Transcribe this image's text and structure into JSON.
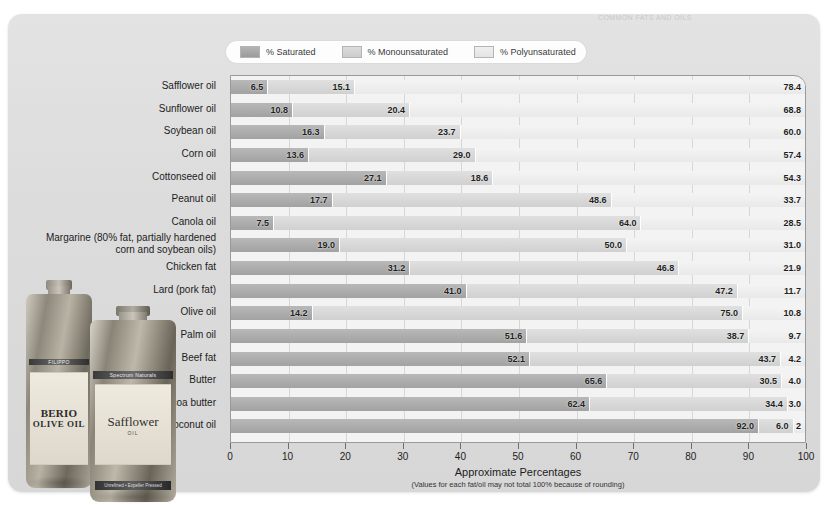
{
  "poster": {
    "top_strip_text": "COMMON FATS AND OILS"
  },
  "legend": {
    "items": [
      {
        "label": "% Saturated",
        "color": "#a2a2a2"
      },
      {
        "label": "% Monounsaturated",
        "color": "#d0d0d0"
      },
      {
        "label": "% Polyunsaturated",
        "color": "#e9e9e9"
      }
    ]
  },
  "axis": {
    "title": "Approximate Percentages",
    "subtitle": "(Values for each fat/oil may not total 100% because of rounding)",
    "ticks": [
      "0",
      "10",
      "20",
      "30",
      "40",
      "50",
      "60",
      "70",
      "80",
      "90",
      "100"
    ]
  },
  "photo": {
    "bottle1": {
      "brand": "FILIPPO",
      "brand2": "BERIO",
      "product": "OLIVE OIL"
    },
    "bottle2": {
      "neckband": "Spectrum Naturals",
      "product": "Safflower",
      "sub": "OIL",
      "footband": "Unrefined  •  Expeller Pressed"
    }
  },
  "chart_data": {
    "type": "bar",
    "orientation": "horizontal",
    "stacked": true,
    "title": "Approximate Percentages",
    "xlabel": "Approximate Percentages",
    "ylabel": "",
    "xlim": [
      0,
      100
    ],
    "grid": true,
    "legend_position": "top",
    "categories": [
      "Safflower oil",
      "Sunflower oil",
      "Soybean oil",
      "Corn oil",
      "Cottonseed oil",
      "Peanut oil",
      "Canola oil",
      "Margarine (80% fat, partially hardened corn and soybean oils)",
      "Chicken fat",
      "Lard (pork fat)",
      "Olive oil",
      "Palm oil",
      "Beef fat",
      "Butter",
      "Cocoa butter",
      "Coconut oil"
    ],
    "series": [
      {
        "name": "% Saturated",
        "values": [
          6.5,
          10.8,
          16.3,
          13.6,
          27.1,
          17.7,
          7.5,
          19.0,
          31.2,
          41.0,
          14.2,
          51.6,
          52.1,
          65.6,
          62.4,
          92.0
        ]
      },
      {
        "name": "% Monounsaturated",
        "values": [
          15.1,
          20.4,
          23.7,
          29.0,
          18.6,
          48.6,
          64.0,
          50.0,
          46.8,
          47.2,
          75.0,
          38.7,
          43.7,
          30.5,
          34.4,
          6.0
        ]
      },
      {
        "name": "% Polyunsaturated",
        "values": [
          78.4,
          68.8,
          60.0,
          57.4,
          54.3,
          33.7,
          28.5,
          31.0,
          21.9,
          11.7,
          10.8,
          9.7,
          4.2,
          4.0,
          3.0,
          2.0
        ]
      }
    ],
    "labels": [
      {
        "category": "Safflower oil",
        "saturated": "6.5",
        "mono": "15.1",
        "poly": "78.4"
      },
      {
        "category": "Sunflower oil",
        "saturated": "10.8",
        "mono": "20.4",
        "poly": "68.8"
      },
      {
        "category": "Soybean oil",
        "saturated": "16.3",
        "mono": "23.7",
        "poly": "60.0"
      },
      {
        "category": "Corn oil",
        "saturated": "13.6",
        "mono": "29.0",
        "poly": "57.4"
      },
      {
        "category": "Cottonseed oil",
        "saturated": "27.1",
        "mono": "18.6",
        "poly": "54.3"
      },
      {
        "category": "Peanut oil",
        "saturated": "17.7",
        "mono": "48.6",
        "poly": "33.7"
      },
      {
        "category": "Canola oil",
        "saturated": "7.5",
        "mono": "64.0",
        "poly": "28.5"
      },
      {
        "category": "Margarine (80% fat, partially hardened corn and soybean oils)",
        "saturated": "19.0",
        "mono": "50.0",
        "poly": "31.0"
      },
      {
        "category": "Chicken fat",
        "saturated": "31.2",
        "mono": "46.8",
        "poly": "21.9"
      },
      {
        "category": "Lard (pork fat)",
        "saturated": "41.0",
        "mono": "47.2",
        "poly": "11.7"
      },
      {
        "category": "Olive oil",
        "saturated": "14.2",
        "mono": "75.0",
        "poly": "10.8"
      },
      {
        "category": "Palm oil",
        "saturated": "51.6",
        "mono": "38.7",
        "poly": "9.7"
      },
      {
        "category": "Beef fat",
        "saturated": "52.1",
        "mono": "43.7",
        "poly": "4.2"
      },
      {
        "category": "Butter",
        "saturated": "65.6",
        "mono": "30.5",
        "poly": "4.0"
      },
      {
        "category": "Cocoa butter",
        "saturated": "62.4",
        "mono": "34.4",
        "poly": "3.0"
      },
      {
        "category": "Coconut oil",
        "saturated": "92.0",
        "mono": "6.0",
        "poly": "2"
      }
    ],
    "y_axis_labels": [
      {
        "line1": "Safflower oil"
      },
      {
        "line1": "Sunflower oil"
      },
      {
        "line1": "Soybean oil"
      },
      {
        "line1": "Corn oil"
      },
      {
        "line1": "Cottonseed oil"
      },
      {
        "line1": "Peanut oil"
      },
      {
        "line1": "Canola oil"
      },
      {
        "line1": "Margarine (80% fat, partially hardened",
        "line2": "corn and soybean oils)"
      },
      {
        "line1": "Chicken fat"
      },
      {
        "line1": "Lard (pork fat)"
      },
      {
        "line1": "Olive oil"
      },
      {
        "line1": "Palm oil"
      },
      {
        "line1": "Beef fat"
      },
      {
        "line1": "Butter"
      },
      {
        "line1": "Cocoa butter"
      },
      {
        "line1": "Coconut oil"
      }
    ]
  }
}
